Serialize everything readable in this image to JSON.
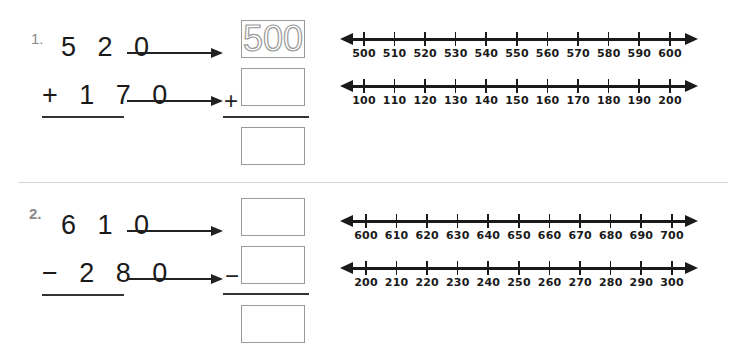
{
  "problems": [
    {
      "number": "1.",
      "top": "5 2 0",
      "bottom": "+ 1 7 0",
      "operator": "+",
      "rounded_top": "500",
      "rounded_bottom": "",
      "rounded_answer": "",
      "number_lines": [
        {
          "labels": [
            "500",
            "510",
            "520",
            "530",
            "540",
            "550",
            "560",
            "570",
            "580",
            "590",
            "600"
          ]
        },
        {
          "labels": [
            "100",
            "110",
            "120",
            "130",
            "140",
            "150",
            "160",
            "170",
            "180",
            "190",
            "200"
          ]
        }
      ]
    },
    {
      "number": "2.",
      "top": "6 1 0",
      "bottom": "− 2 8 0",
      "operator": "−",
      "rounded_top": "",
      "rounded_bottom": "",
      "rounded_answer": "",
      "number_lines": [
        {
          "labels": [
            "600",
            "610",
            "620",
            "630",
            "640",
            "650",
            "660",
            "670",
            "680",
            "690",
            "700"
          ]
        },
        {
          "labels": [
            "200",
            "210",
            "220",
            "230",
            "240",
            "250",
            "260",
            "270",
            "280",
            "290",
            "300"
          ]
        }
      ]
    }
  ]
}
